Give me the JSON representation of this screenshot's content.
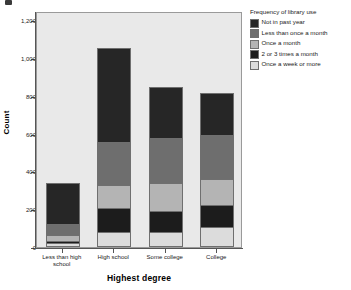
{
  "chart_data": {
    "type": "bar",
    "subtype": "stacked",
    "title": "",
    "xlabel": "Highest degree",
    "ylabel": "Count",
    "categories": [
      "Less than high school",
      "High school",
      "Some college",
      "College"
    ],
    "series": [
      {
        "name": "Once a week or more",
        "color": "#dcdcdc",
        "values": [
          20,
          82,
          78,
          108
        ]
      },
      {
        "name": "2 or 3 times a month",
        "color": "#1c1c1c",
        "values": [
          12,
          126,
          112,
          112
        ]
      },
      {
        "name": "Once a month",
        "color": "#b4b4b4",
        "values": [
          30,
          122,
          148,
          138
        ]
      },
      {
        "name": "Less than once a month",
        "color": "#6e6e6e",
        "values": [
          60,
          226,
          240,
          235
        ]
      },
      {
        "name": "Not in past year",
        "color": "#262626",
        "values": [
          216,
          499,
          272,
          222
        ]
      }
    ],
    "totals": [
      338,
      1055,
      850,
      815
    ],
    "ylim": [
      0,
      1250
    ],
    "yticks": [
      0,
      200,
      400,
      600,
      800,
      1000,
      1200
    ],
    "ytick_labels": [
      "0",
      "200",
      "400",
      "600",
      "800",
      "1,000",
      "1,200"
    ],
    "grid": false,
    "legend_position": "right",
    "plot_background": "#e9e9e9"
  },
  "legend": {
    "title": "Frequency of library use",
    "items": [
      {
        "label": "Not in past year",
        "color": "#262626"
      },
      {
        "label": "Less than once a month",
        "color": "#6e6e6e"
      },
      {
        "label": "Once a month",
        "color": "#b4b4b4"
      },
      {
        "label": "2 or 3 times a month",
        "color": "#1c1c1c"
      },
      {
        "label": "Once a week or more",
        "color": "#dcdcdc"
      }
    ]
  }
}
